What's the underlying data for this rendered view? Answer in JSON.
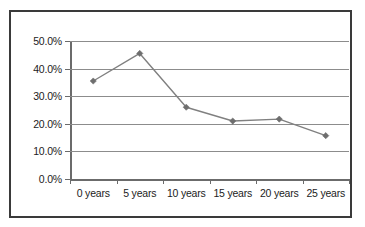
{
  "chart_data": {
    "type": "line",
    "title": "",
    "subtitle": "",
    "xlabel": "",
    "ylabel": "",
    "categories": [
      "0 years",
      "5 years",
      "10 years",
      "15 years",
      "20 years",
      "25 years"
    ],
    "values": [
      0.355,
      0.455,
      0.26,
      0.21,
      0.217,
      0.157
    ],
    "series": [
      {
        "name": "",
        "values": [
          0.355,
          0.455,
          0.26,
          0.21,
          0.217,
          0.157
        ]
      }
    ],
    "ylim": [
      0.0,
      0.5
    ],
    "ytick_labels": [
      "0.0%",
      "10.0%",
      "20.0%",
      "30.0%",
      "40.0%",
      "50.0%"
    ],
    "ytick_values": [
      0.0,
      0.1,
      0.2,
      0.3,
      0.4,
      0.5
    ],
    "xtick_labels": [
      "0 years",
      "5 years",
      "10 years",
      "15 years",
      "20 years",
      "25 years"
    ],
    "grid": true,
    "legend": false,
    "legend_position": "none",
    "annotations": [],
    "colors": {
      "line": "#808080",
      "marker": "#6e6e6e",
      "gridline": "#8c8c8c",
      "axis": "#6b6b6b",
      "border": "#3a3a3a",
      "text": "#1c1c1c",
      "background": "#ffffff"
    },
    "marker_shape": "diamond"
  }
}
